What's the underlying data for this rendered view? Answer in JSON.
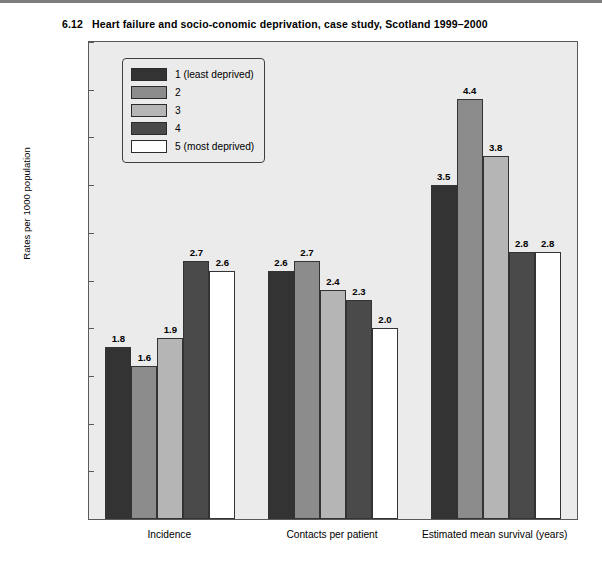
{
  "figure": {
    "number": "6.12",
    "title": "Heart failure and socio-conomic deprivation, case study, Scotland 1999–2000"
  },
  "chart_data": {
    "type": "bar",
    "title": "Heart failure and socio-conomic deprivation, case study, Scotland 1999–2000",
    "xlabel": "",
    "ylabel": "Rates per 1000 population",
    "ylim": [
      0,
      5.0
    ],
    "yticks": [
      "0",
      "0.5",
      "1.0",
      "1.5",
      "2.0",
      "2.5",
      "3.0",
      "3.5",
      "4.0",
      "4.5",
      "5.0"
    ],
    "ytick_values": [
      0,
      0.5,
      1.0,
      1.5,
      2.0,
      2.5,
      3.0,
      3.5,
      4.0,
      4.5,
      5.0
    ],
    "grid": false,
    "legend_position": "top-left inside plot",
    "categories": [
      "Incidence",
      "Contacts per patient",
      "Estimated mean survival (years)"
    ],
    "series": [
      {
        "name": "1 (least deprived)",
        "color": "#333333",
        "values": [
          1.8,
          2.6,
          3.5
        ],
        "labels": [
          "1.8",
          "2.6",
          "3.5"
        ]
      },
      {
        "name": "2",
        "color": "#8c8c8c",
        "values": [
          1.6,
          2.7,
          4.4
        ],
        "labels": [
          "1.6",
          "2.7",
          "4.4"
        ]
      },
      {
        "name": "3",
        "color": "#b5b5b5",
        "values": [
          1.9,
          2.4,
          3.8
        ],
        "labels": [
          "1.9",
          "2.4",
          "3.8"
        ]
      },
      {
        "name": "4",
        "color": "#4a4a4a",
        "values": [
          2.7,
          2.3,
          2.8
        ],
        "labels": [
          "2.7",
          "2.3",
          "2.8"
        ]
      },
      {
        "name": "5 (most deprived)",
        "color": "#ffffff",
        "values": [
          2.6,
          2.0,
          2.8
        ],
        "labels": [
          "2.6",
          "2.0",
          "2.8"
        ]
      }
    ],
    "plot_background": "#ebebeb",
    "bar_edge_color": "#333333"
  }
}
